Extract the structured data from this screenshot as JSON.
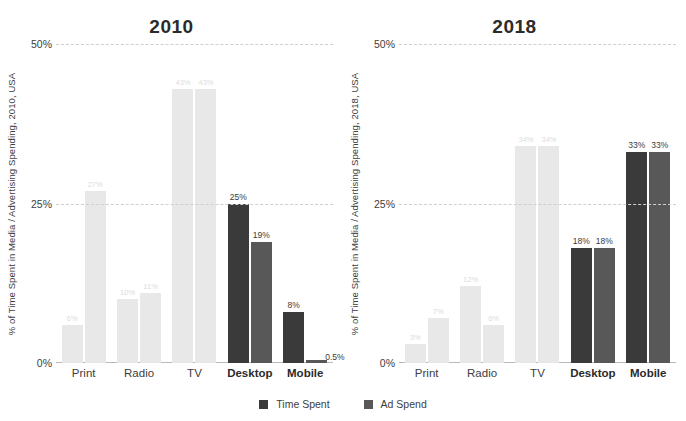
{
  "legend": {
    "position": "bottom-center",
    "items": [
      {
        "label": "Time Spent",
        "color": "#3a3a3a"
      },
      {
        "label": "Ad Spend",
        "color": "#585858"
      }
    ]
  },
  "colors": {
    "time_spent_dark": "#3a3a3a",
    "ad_spend_mid": "#585858",
    "muted_bar": "#e8e8e8",
    "gridline": "#cfcfcf",
    "text": "#3d3d3d"
  },
  "chart_data": [
    {
      "type": "bar",
      "title": "2010",
      "xlabel": "",
      "ylabel": "% of Time Spent in Media / Advertising Spending, 2010, USA",
      "ylim": [
        0,
        50
      ],
      "yticks": [
        "0%",
        "25%",
        "50%"
      ],
      "ytick_values": [
        0,
        25,
        50
      ],
      "grid": true,
      "categories": [
        "Print",
        "Radio",
        "TV",
        "Desktop",
        "Mobile"
      ],
      "emphasized_categories": [
        "Desktop",
        "Mobile"
      ],
      "series": [
        {
          "name": "Time Spent",
          "values": [
            6,
            10,
            43,
            25,
            8
          ],
          "labels": [
            "6%",
            "10%",
            "43%",
            "25%",
            "8%"
          ]
        },
        {
          "name": "Ad Spend",
          "values": [
            27,
            11,
            43,
            19,
            0.5
          ],
          "labels": [
            "27%",
            "11%",
            "43%",
            "19%",
            "0.5%"
          ]
        }
      ]
    },
    {
      "type": "bar",
      "title": "2018",
      "xlabel": "",
      "ylabel": "% of Time Spent in Media / Advertising Spending, 2018, USA",
      "ylim": [
        0,
        50
      ],
      "yticks": [
        "0%",
        "25%",
        "50%"
      ],
      "ytick_values": [
        0,
        25,
        50
      ],
      "grid": true,
      "categories": [
        "Print",
        "Radio",
        "TV",
        "Desktop",
        "Mobile"
      ],
      "emphasized_categories": [
        "Desktop",
        "Mobile"
      ],
      "series": [
        {
          "name": "Time Spent",
          "values": [
            3,
            12,
            34,
            18,
            33
          ],
          "labels": [
            "3%",
            "12%",
            "34%",
            "18%",
            "33%"
          ]
        },
        {
          "name": "Ad Spend",
          "values": [
            7,
            6,
            34,
            18,
            33
          ],
          "labels": [
            "7%",
            "6%",
            "34%",
            "18%",
            "33%"
          ]
        }
      ]
    }
  ]
}
